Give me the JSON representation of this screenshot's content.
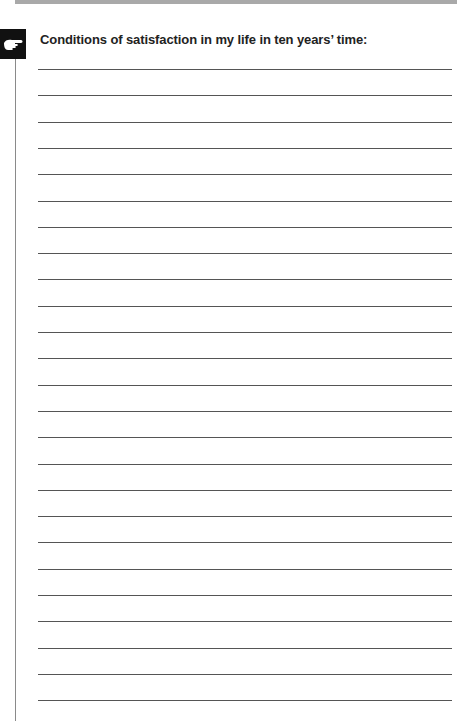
{
  "page": {
    "heading": "Conditions of satisfaction in my life in ten years’ time:",
    "icon": "pointing-hand-icon",
    "lines": {
      "count": 25,
      "first_y": 69,
      "spacing": 26.3
    },
    "colors": {
      "top_bar": "#a9a9a9",
      "icon_background": "#111111",
      "rule": "#555555",
      "text": "#222222"
    }
  }
}
